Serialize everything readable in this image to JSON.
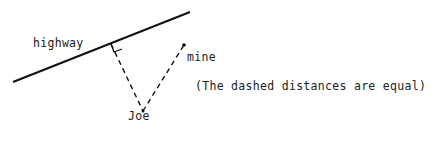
{
  "diagram": {
    "labels": {
      "highway": "highway",
      "mine": "mine",
      "joe": "Joe",
      "note": "(The dashed distances are equal)"
    },
    "colors": {
      "line": "#111111",
      "text": "#222222",
      "background": "#ffffff"
    }
  }
}
